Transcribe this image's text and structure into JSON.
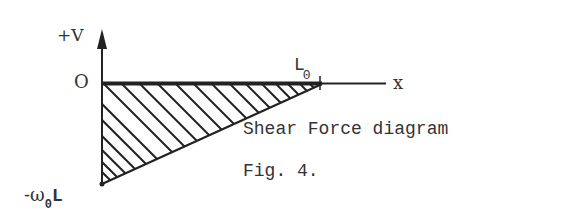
{
  "diagram": {
    "type": "shear-force-diagram",
    "labels": {
      "y_axis": "+V",
      "origin": "O",
      "x_axis": "x",
      "length": "L",
      "length_subscript": "0",
      "min_value_prefix": "-ω",
      "min_value_subscript": "0",
      "min_value_suffix": "L",
      "caption": "Shear Force diagram",
      "figure_number": "Fig. 4."
    },
    "colors": {
      "ink": "#222222",
      "background": "#ffffff"
    },
    "geometry": {
      "description": "Hatched triangle below the x-axis; shear is -ω0·L at x=0, rising linearly to 0 at x=L0",
      "points": [
        {
          "x": "0",
          "V": "-ω0L"
        },
        {
          "x": "L0",
          "V": "0"
        }
      ]
    }
  }
}
